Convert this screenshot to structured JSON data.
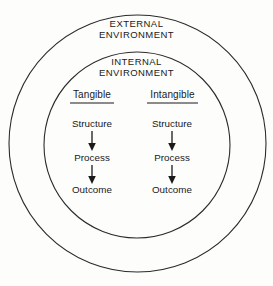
{
  "diagram": {
    "type": "concentric-circles-flow",
    "colors": {
      "background": "#fdfdfc",
      "stroke": "#2b2b2b",
      "text": "#1a1a1a"
    },
    "rings": [
      {
        "name": "external-environment-ring",
        "label": "EXTERNAL\nENVIRONMENT",
        "cx": 137.5,
        "cy": 143.5,
        "r": 128.5
      },
      {
        "name": "internal-environment-ring",
        "label": "INTERNAL\nENVIRONMENT",
        "cx": 137.0,
        "cy": 145.0,
        "r": 93.0
      }
    ],
    "labels": {
      "external_environment_line1": "EXTERNAL",
      "external_environment_line2": "ENVIRONMENT",
      "internal_environment_line1": "INTERNAL",
      "internal_environment_line2": "ENVIRONMENT"
    },
    "columns": [
      {
        "name": "tangible",
        "heading": "Tangible",
        "heading_underlined": true,
        "center_x": 92,
        "nodes": [
          "Structure",
          "Process",
          "Outcome"
        ]
      },
      {
        "name": "intangible",
        "heading": "Intangible",
        "heading_underlined": true,
        "center_x": 172,
        "nodes": [
          "Structure",
          "Process",
          "Outcome"
        ]
      }
    ],
    "flow": {
      "arrows": [
        {
          "from": "Structure",
          "to": "Process"
        },
        {
          "from": "Process",
          "to": "Outcome"
        }
      ],
      "direction": "downward"
    }
  }
}
